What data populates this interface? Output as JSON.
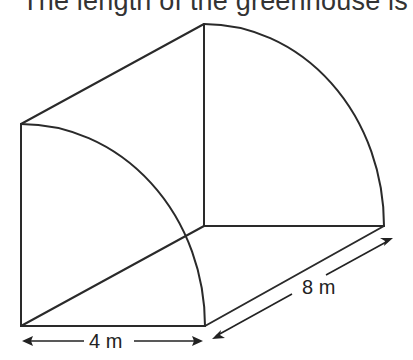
{
  "caption": "The length of the greenhouse is",
  "diagram": {
    "shape": "quarter-cylinder greenhouse",
    "labels": {
      "width": "4 m",
      "length": "8 m"
    },
    "colors": {
      "line": "#2a2a2a",
      "background": "#ffffff"
    }
  }
}
